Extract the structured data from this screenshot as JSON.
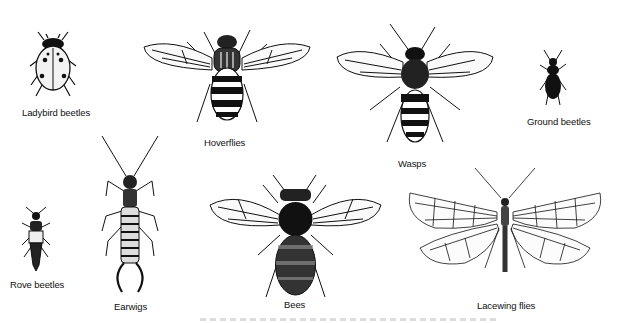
{
  "figure": {
    "background": "#ffffff",
    "ink_color": "#111111",
    "insects": [
      {
        "id": "ladybird",
        "label": "Ladybird beetles",
        "icon": "ladybird-beetle-icon"
      },
      {
        "id": "hoverfly",
        "label": "Hoverflies",
        "icon": "hoverfly-icon"
      },
      {
        "id": "wasp",
        "label": "Wasps",
        "icon": "wasp-icon"
      },
      {
        "id": "ground",
        "label": "Ground beetles",
        "icon": "ground-beetle-icon"
      },
      {
        "id": "rove",
        "label": "Rove beetles",
        "icon": "rove-beetle-icon"
      },
      {
        "id": "earwig",
        "label": "Earwigs",
        "icon": "earwig-icon"
      },
      {
        "id": "bee",
        "label": "Bees",
        "icon": "bee-icon"
      },
      {
        "id": "lacewing",
        "label": "Lacewing flies",
        "icon": "lacewing-fly-icon"
      }
    ]
  }
}
